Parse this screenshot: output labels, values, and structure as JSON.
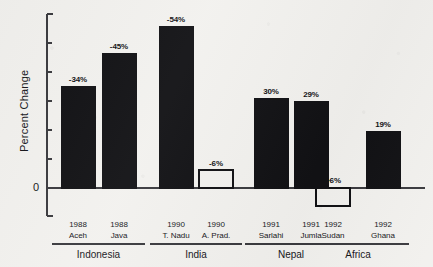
{
  "chart_data": {
    "type": "bar",
    "title": "",
    "subtitle": "",
    "xlabel": "",
    "ylabel": "Percent Change",
    "ylim": [
      -12,
      60
    ],
    "y_zero_label": "0",
    "y_tick_count": 6,
    "grid": false,
    "legend": null,
    "orientation": "vertical",
    "note": "Bars are drawn as magnitude of percent change; the +6% Sudan bar is drawn below the zero baseline as an outlined bar, and the -6% A. Prad. bar is drawn above the baseline as an outlined bar.",
    "categories": [
      "1988 Aceh",
      "1988 Java",
      "1990 T. Nadu",
      "1990 A. Prad.",
      "1991 Sarlahi",
      "1991 Jumla",
      "1992 Sudan",
      "1992 Ghana"
    ],
    "values": [
      -34,
      -45,
      -54,
      -6,
      30,
      29,
      6,
      19
    ],
    "bars": [
      {
        "year": "1988",
        "place": "Aceh",
        "label": "-34%",
        "magnitude": 34,
        "style": "filled",
        "direction": "up",
        "group": "Indonesia"
      },
      {
        "year": "1988",
        "place": "Java",
        "label": "-45%",
        "magnitude": 45,
        "style": "filled",
        "direction": "up",
        "group": "Indonesia"
      },
      {
        "year": "1990",
        "place": "T. Nadu",
        "label": "-54%",
        "magnitude": 54,
        "style": "filled",
        "direction": "up",
        "group": "India"
      },
      {
        "year": "1990",
        "place": "A. Prad.",
        "label": "-6%",
        "magnitude": 6,
        "style": "outlined",
        "direction": "up",
        "group": "India"
      },
      {
        "year": "1991",
        "place": "Sarlahi",
        "label": "30%",
        "magnitude": 30,
        "style": "filled",
        "direction": "up",
        "group": "Nepal"
      },
      {
        "year": "1991",
        "place": "Jumla",
        "label": "29%",
        "magnitude": 29,
        "style": "filled",
        "direction": "up",
        "group": "Nepal"
      },
      {
        "year": "1992",
        "place": "Sudan",
        "label": "+6%",
        "magnitude": 6,
        "style": "outlined",
        "direction": "down",
        "group": "Africa"
      },
      {
        "year": "1992",
        "place": "Ghana",
        "label": "19%",
        "magnitude": 19,
        "style": "filled",
        "direction": "up",
        "group": "Africa"
      }
    ],
    "groups": [
      {
        "name": "Indonesia",
        "bar_indices": [
          0,
          1
        ]
      },
      {
        "name": "India",
        "bar_indices": [
          2,
          3
        ]
      },
      {
        "name": "Nepal",
        "bar_indices": [
          4,
          5
        ]
      },
      {
        "name": "Africa",
        "bar_indices": [
          6,
          7
        ]
      }
    ],
    "colors": {
      "bar_fill": "#111114",
      "bar_outline": "#111114",
      "background": "#f2f1ee",
      "axis": "#3a3a3e",
      "text": "#16161a"
    }
  }
}
